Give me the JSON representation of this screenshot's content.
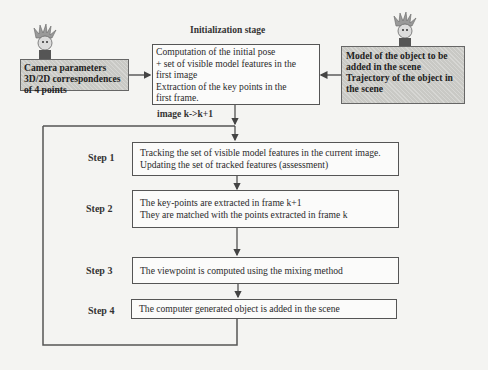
{
  "diagram": {
    "title": "Initialization stage",
    "inputs": {
      "camera": {
        "lines": [
          "Camera parameters",
          "3D/2D correspondences",
          "of 4 points"
        ]
      },
      "model": {
        "lines": [
          "Model of the object to be",
          "added in the scene",
          "Trajectory of the object in",
          "the scene"
        ]
      }
    },
    "init_box": {
      "lines": [
        "Computation of the initial pose",
        "+ set of visible model features in the",
        "first image",
        "Extraction of the  key points in the",
        "first frame."
      ]
    },
    "loop_label": "image k->k+1",
    "steps": [
      {
        "label": "Step 1",
        "lines": [
          "Tracking the set of visible model features in the current image.",
          "Updating the set of tracked features (assessment)"
        ]
      },
      {
        "label": "Step 2",
        "lines": [
          "The key-points are extracted in frame k+1",
          "They are matched with the points extracted in frame k"
        ]
      },
      {
        "label": "Step 3",
        "lines": [
          "The viewpoint is computed using the mixing method"
        ]
      },
      {
        "label": "Step 4",
        "lines": [
          "The computer generated object is added in the scene"
        ]
      }
    ],
    "icons": [
      "cartoon-character-left",
      "cartoon-character-right"
    ]
  }
}
